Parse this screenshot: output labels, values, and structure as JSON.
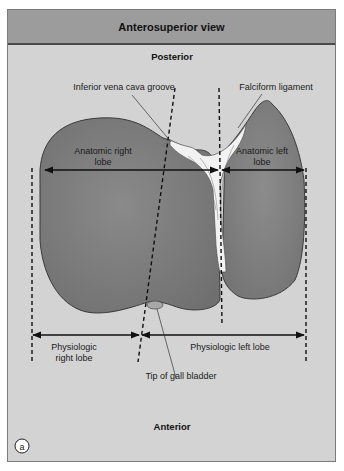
{
  "header": {
    "title": "Anterosuperior view"
  },
  "orientation": {
    "top": "Posterior",
    "bottom": "Anterior"
  },
  "labels": {
    "ivc_groove": "Inferior vena cava groove",
    "falciform": "Falciform ligament",
    "anat_right_1": "Anatomic right",
    "anat_right_2": "lobe",
    "anat_left_1": "Anatomic left",
    "anat_left_2": "lobe",
    "phys_right_1": "Physiologic",
    "phys_right_2": "right lobe",
    "phys_left": "Physiologic left lobe",
    "gallbladder": "Tip of gall bladder"
  },
  "panel_marker": "a",
  "colors": {
    "header_bg": "#9c9c9c",
    "body_bg": "#d3d3d3",
    "liver": "#7f7f7f",
    "ligament": "#f2f2f2",
    "line": "#111111"
  }
}
